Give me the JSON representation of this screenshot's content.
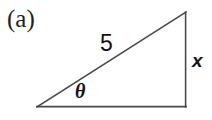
{
  "figure": {
    "panel_label": "(a)",
    "type": "right-triangle-diagram",
    "background_color": "#ffffff",
    "stroke_color": "#4a4a4a",
    "text_color": "#121212",
    "canvas": {
      "width": 212,
      "height": 120
    }
  },
  "geometry": {
    "vertices": {
      "left_angle_vertex": {
        "x": 37,
        "y": 107
      },
      "top_apex": {
        "x": 186,
        "y": 12
      },
      "right_angle_vertex": {
        "x": 186,
        "y": 107
      }
    },
    "edges": [
      {
        "name": "hypotenuse",
        "from": "left_angle_vertex",
        "to": "top_apex"
      },
      {
        "name": "vertical-leg",
        "from": "top_apex",
        "to": "right_angle_vertex"
      },
      {
        "name": "horizontal-leg",
        "from": "right_angle_vertex",
        "to": "left_angle_vertex"
      }
    ]
  },
  "labels": {
    "hypotenuse": "5",
    "opposite_side": "x",
    "angle": "θ"
  },
  "chart_data": {
    "type": "diagram",
    "title": "(a)",
    "shape": "right triangle",
    "annotations": [
      {
        "name": "hypotenuse-length",
        "text": "5",
        "attached_to": "hypotenuse"
      },
      {
        "name": "opposite-side-length",
        "text": "x",
        "attached_to": "vertical-leg"
      },
      {
        "name": "base-angle",
        "text": "θ",
        "attached_to": "left_angle_vertex"
      }
    ]
  }
}
